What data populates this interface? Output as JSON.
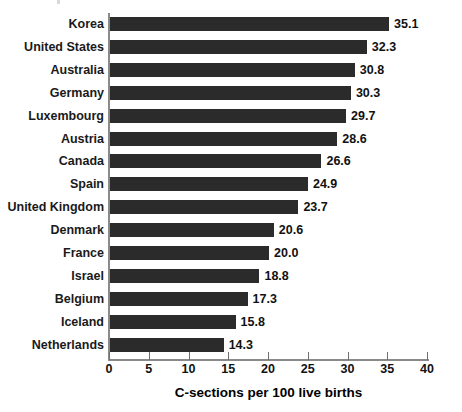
{
  "chart_data": {
    "type": "bar",
    "orientation": "horizontal",
    "title": "",
    "xlabel": "C-sections per 100 live births",
    "ylabel": "",
    "xlim": [
      0,
      40
    ],
    "xticks": [
      0,
      5,
      10,
      15,
      20,
      25,
      30,
      35,
      40
    ],
    "xtick_labels": [
      "0",
      "5",
      "10",
      "15",
      "20",
      "25",
      "30",
      "35",
      "40"
    ],
    "grid": false,
    "legend": false,
    "bar_color": "#2b2b2b",
    "axis_color": "#8a8a8a",
    "categories": [
      "Korea",
      "United States",
      "Australia",
      "Germany",
      "Luxembourg",
      "Austria",
      "Canada",
      "Spain",
      "United Kingdom",
      "Denmark",
      "France",
      "Israel",
      "Belgium",
      "Iceland",
      "Netherlands"
    ],
    "values": [
      35.1,
      32.3,
      30.8,
      30.3,
      29.7,
      28.6,
      26.6,
      24.9,
      23.7,
      20.6,
      20.0,
      18.8,
      17.3,
      15.8,
      14.3
    ],
    "value_labels": [
      "35.1",
      "32.3",
      "30.8",
      "30.3",
      "29.7",
      "28.6",
      "26.6",
      "24.9",
      "23.7",
      "20.6",
      "20.0",
      "18.8",
      "17.3",
      "15.8",
      "14.3"
    ]
  }
}
